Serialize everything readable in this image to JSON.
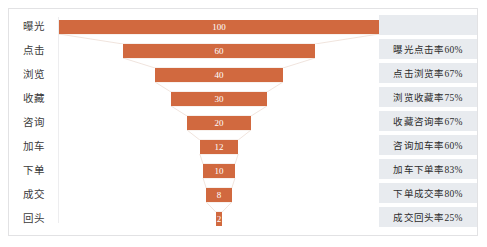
{
  "chart_data": {
    "type": "bar",
    "title": "",
    "subtitle": "",
    "xlabel": "",
    "ylabel": "",
    "grid": false,
    "legend_position": "none",
    "orientation": "horizontal-funnel",
    "bar_color": "#d1693f",
    "value_label_color": "#ffffff",
    "panel_band_color": "#e8ebef",
    "categories": [
      "曝光",
      "点击",
      "浏览",
      "收藏",
      "咨询",
      "加车",
      "下单",
      "成交",
      "回头"
    ],
    "values": [
      100,
      60,
      40,
      30,
      20,
      12,
      10,
      8,
      2
    ],
    "value_labels": [
      "100",
      "60",
      "40",
      "30",
      "20",
      "12",
      "10",
      "8",
      "2"
    ],
    "ylim": [
      0,
      100
    ],
    "conversion_rates": [
      {
        "label": "曝光点击率60%",
        "from": "曝光",
        "to": "点击",
        "rate": 60
      },
      {
        "label": "点击浏览率67%",
        "from": "点击",
        "to": "浏览",
        "rate": 67
      },
      {
        "label": "浏览收藏率75%",
        "from": "浏览",
        "to": "收藏",
        "rate": 75
      },
      {
        "label": "收藏咨询率67%",
        "from": "收藏",
        "to": "咨询",
        "rate": 67
      },
      {
        "label": "咨询加车率60%",
        "from": "咨询",
        "to": "加车",
        "rate": 60
      },
      {
        "label": "加车下单率83%",
        "from": "加车",
        "to": "下单",
        "rate": 83
      },
      {
        "label": "下单成交率80%",
        "from": "下单",
        "to": "成交",
        "rate": 80
      },
      {
        "label": "成交回头率25%",
        "from": "成交",
        "to": "回头",
        "rate": 25
      }
    ]
  }
}
